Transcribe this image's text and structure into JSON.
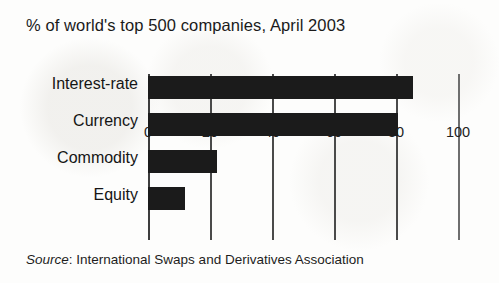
{
  "chart_data": {
    "type": "bar",
    "orientation": "horizontal",
    "title": "% of world's top 500 companies, April 2003",
    "xlabel": "",
    "ylabel": "",
    "categories": [
      "Interest-rate",
      "Currency",
      "Commodity",
      "Equity"
    ],
    "values": [
      85,
      80,
      22,
      12
    ],
    "xlim": [
      0,
      100
    ],
    "xticks": [
      0,
      20,
      40,
      60,
      80,
      100
    ],
    "xtick_labels": [
      "0",
      "20",
      "40",
      "60",
      "80",
      "100"
    ],
    "grid": true,
    "grid_axis": "x",
    "legend": null,
    "bar_color": "#1b1b1b",
    "background_color": "#fdfdfc",
    "annotations": {
      "source_prefix": "Source",
      "source_separator": ": ",
      "source_text": "International Swaps and Derivatives Association"
    }
  }
}
